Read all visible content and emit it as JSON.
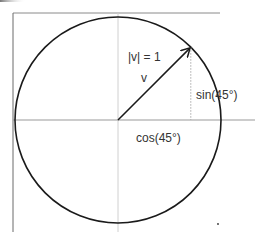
{
  "diagram": {
    "labels": {
      "magnitude": "|v| = 1",
      "vector": "v",
      "sin": "sin(45°)",
      "cos": "cos(45°)"
    },
    "angle_degrees": 45,
    "radius_units": 1,
    "colors": {
      "circle": "#1a1a1a",
      "vector": "#1a1a1a",
      "axis": "#9a9a9a",
      "frame": "#8a8a8a",
      "dotted": "#aaaaaa",
      "text": "#333333"
    }
  }
}
